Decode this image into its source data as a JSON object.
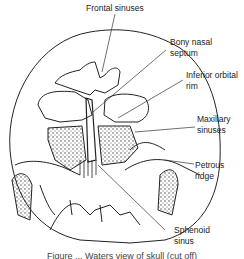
{
  "diagram": {
    "labels": {
      "frontal_sinuses": "Frontal sinuses",
      "bony_nasal_septum_1": "Bony nasal",
      "bony_nasal_septum_2": "septum",
      "inferior_orbital_rim_1": "Inferior orbital",
      "inferior_orbital_rim_2": "rim",
      "maxillary_sinuses_1": "Maxillary",
      "maxillary_sinuses_2": "sinuses",
      "petrous_ridge_1": "Petrous",
      "petrous_ridge_2": "ridge",
      "sphenoid_sinus_1": "Sphenoid",
      "sphenoid_sinus_2": "sinus"
    },
    "caption": "Figure ... Waters view of skull (cut off)"
  },
  "colors": {
    "line": "#222222",
    "background": "#ffffff"
  }
}
